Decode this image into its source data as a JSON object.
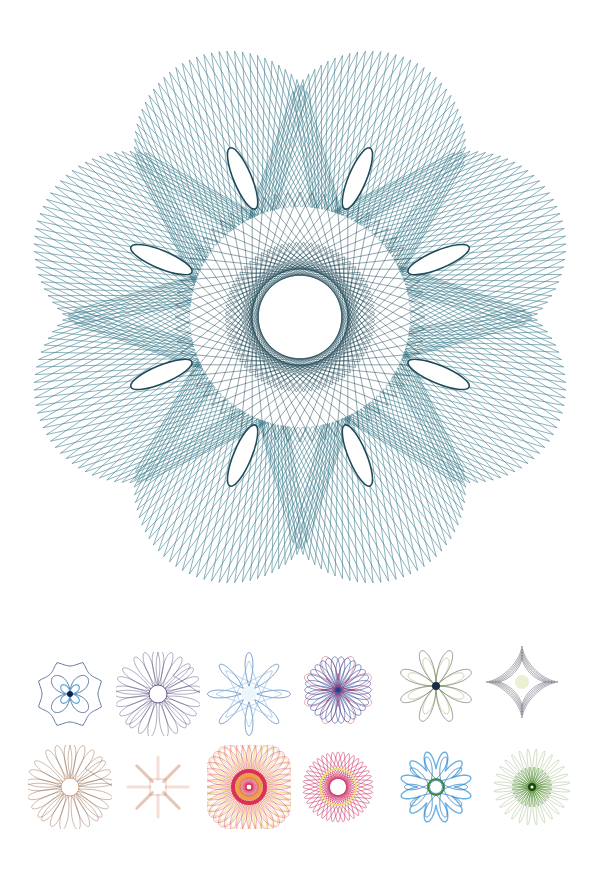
{
  "main_pattern": {
    "name": "large-teal-string-rosette",
    "color": "#3f7f8e",
    "dark_color": "#1f4a58",
    "petals": 8,
    "rotation_symmetry": 8
  },
  "thumbnails": [
    {
      "name": "thumb-blue-cross-octagon",
      "colors": [
        "#3a5a8c",
        "#5fa9d6",
        "#10204a"
      ],
      "type": "cross"
    },
    {
      "name": "thumb-purple-ring-rosette",
      "colors": [
        "#4a3a6e",
        "#6b5a8e"
      ],
      "type": "ring",
      "loops": 24
    },
    {
      "name": "thumb-blue-star-rosette",
      "colors": [
        "#2a5ca8",
        "#7fb3e0"
      ],
      "type": "star",
      "loops": 16
    },
    {
      "name": "thumb-pink-blue-star",
      "colors": [
        "#e07a96",
        "#2a3d8f",
        "#c03060"
      ],
      "type": "spiky",
      "loops": 8
    },
    {
      "name": "thumb-gray-green-flower",
      "colors": [
        "#4a4a4a",
        "#7a9a3a",
        "#1a2a4a"
      ],
      "type": "flower",
      "loops": 8
    },
    {
      "name": "thumb-gray-four-point-star",
      "colors": [
        "#555566",
        "#c8d07a"
      ],
      "type": "astroid",
      "loops": 4
    },
    {
      "name": "thumb-brown-rosette",
      "colors": [
        "#8a5a3a",
        "#d8a080"
      ],
      "type": "ring",
      "loops": 16
    },
    {
      "name": "thumb-faded-orange-cross",
      "colors": [
        "#e8b8a0",
        "#c88060"
      ],
      "type": "faded",
      "loops": 8
    },
    {
      "name": "thumb-red-yellow-ring",
      "colors": [
        "#d8305a",
        "#e8c040",
        "#f0a040"
      ],
      "type": "dense",
      "loops": 30
    },
    {
      "name": "thumb-pink-yellow-ring",
      "colors": [
        "#d04070",
        "#e8e070"
      ],
      "type": "ring2",
      "loops": 20
    },
    {
      "name": "thumb-blue-green-star",
      "colors": [
        "#2a7ac0",
        "#5aa8e0",
        "#3a8a3a"
      ],
      "type": "blob",
      "loops": 12
    },
    {
      "name": "thumb-green-sunburst",
      "colors": [
        "#4a8a2a",
        "#1a4a0a",
        "#8aaa6a"
      ],
      "type": "sunburst",
      "loops": 28
    }
  ]
}
